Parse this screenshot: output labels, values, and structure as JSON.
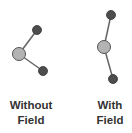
{
  "diagram": {
    "panels": [
      {
        "label_line1": "Without",
        "label_line2": "Field",
        "center_atom": {
          "x": 19,
          "y": 54,
          "r": 6.5
        },
        "outer_atoms": [
          {
            "x": 37,
            "y": 30,
            "r": 4.5
          },
          {
            "x": 43,
            "y": 71,
            "r": 4.5
          }
        ]
      },
      {
        "label_line1": "With",
        "label_line2": "Field",
        "center_atom": {
          "x": 104,
          "y": 47,
          "r": 6.5
        },
        "outer_atoms": [
          {
            "x": 111,
            "y": 15,
            "r": 4.5
          },
          {
            "x": 113,
            "y": 79,
            "r": 4.5
          }
        ]
      }
    ],
    "colors": {
      "center_atom": "#b3b3b3",
      "outer_atom": "#4d4d4d",
      "bond": "#666666",
      "stroke": "#555555",
      "text": "#333333"
    }
  }
}
